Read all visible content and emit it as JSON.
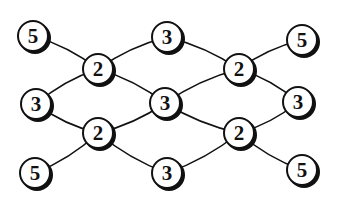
{
  "diagram": {
    "type": "graph",
    "nodes": [
      {
        "id": "n1",
        "label": "5",
        "x": 33,
        "y": 36
      },
      {
        "id": "n2",
        "label": "3",
        "x": 167,
        "y": 37
      },
      {
        "id": "n3",
        "label": "5",
        "x": 302,
        "y": 40
      },
      {
        "id": "n4",
        "label": "2",
        "x": 98,
        "y": 69
      },
      {
        "id": "n5",
        "label": "2",
        "x": 239,
        "y": 69
      },
      {
        "id": "n6",
        "label": "3",
        "x": 36,
        "y": 104
      },
      {
        "id": "n7",
        "label": "3",
        "x": 165,
        "y": 103
      },
      {
        "id": "n8",
        "label": "3",
        "x": 298,
        "y": 102
      },
      {
        "id": "n9",
        "label": "2",
        "x": 98,
        "y": 133
      },
      {
        "id": "n10",
        "label": "2",
        "x": 239,
        "y": 133
      },
      {
        "id": "n11",
        "label": "5",
        "x": 35,
        "y": 173
      },
      {
        "id": "n12",
        "label": "3",
        "x": 167,
        "y": 173
      },
      {
        "id": "n13",
        "label": "5",
        "x": 302,
        "y": 170
      }
    ],
    "edges": [
      [
        "n1",
        "n4"
      ],
      [
        "n4",
        "n2"
      ],
      [
        "n2",
        "n5"
      ],
      [
        "n5",
        "n3"
      ],
      [
        "n4",
        "n6"
      ],
      [
        "n4",
        "n7"
      ],
      [
        "n5",
        "n7"
      ],
      [
        "n5",
        "n8"
      ],
      [
        "n6",
        "n9"
      ],
      [
        "n7",
        "n9"
      ],
      [
        "n7",
        "n10"
      ],
      [
        "n8",
        "n10"
      ],
      [
        "n11",
        "n9"
      ],
      [
        "n9",
        "n12"
      ],
      [
        "n12",
        "n10"
      ],
      [
        "n10",
        "n13"
      ]
    ],
    "colors": {
      "stroke": "#111111",
      "fill": "#ffffff",
      "shadow": "#111111"
    }
  }
}
